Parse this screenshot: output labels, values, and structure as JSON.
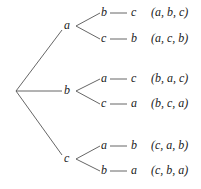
{
  "tree": {
    "root": {
      "x": 16,
      "y": 91
    },
    "level1": [
      {
        "label": "a",
        "x": 68,
        "y": 26
      },
      {
        "label": "b",
        "x": 68,
        "y": 91
      },
      {
        "label": "c",
        "x": 68,
        "y": 159
      }
    ],
    "level2": [
      {
        "label": "b",
        "parent": 0,
        "y": 13
      },
      {
        "label": "c",
        "parent": 0,
        "y": 39
      },
      {
        "label": "a",
        "parent": 1,
        "y": 79
      },
      {
        "label": "c",
        "parent": 1,
        "y": 104
      },
      {
        "label": "a",
        "parent": 2,
        "y": 146
      },
      {
        "label": "b",
        "parent": 2,
        "y": 171
      }
    ],
    "level3": [
      "c",
      "b",
      "c",
      "a",
      "b",
      "a"
    ],
    "permutations": [
      "(a, b, c)",
      "(a, c, b)",
      "(b, a, c)",
      "(b, c, a)",
      "(c, a, b)",
      "(c, b, a)"
    ]
  },
  "colors": {
    "line": "#555555",
    "text": "#222222"
  }
}
